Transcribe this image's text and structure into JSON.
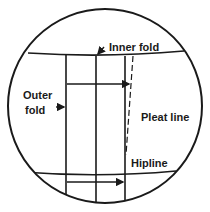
{
  "diagram": {
    "labels": {
      "inner_fold": "Inner fold",
      "outer_fold_line1": "Outer",
      "outer_fold_line2": "fold",
      "pleat_line": "Pleat line",
      "hipline": "Hipline"
    },
    "colors": {
      "stroke": "#1a1a1a",
      "background": "#ffffff"
    }
  }
}
